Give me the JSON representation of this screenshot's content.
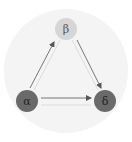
{
  "diagram": {
    "background": {
      "cx": 66,
      "cy": 71,
      "r": 62,
      "fill": "#f4f4f4"
    },
    "nodes": [
      {
        "id": "beta",
        "label": "β",
        "cx": 66,
        "cy": 29,
        "r": 11,
        "fill": "#d6d6d6",
        "text_color": "#555555"
      },
      {
        "id": "alpha",
        "label": "α",
        "cx": 27,
        "cy": 101,
        "r": 11,
        "fill": "#6a6a6a",
        "text_color": "#222222"
      },
      {
        "id": "delta",
        "label": "δ",
        "cx": 105,
        "cy": 101,
        "r": 11,
        "fill": "#6a6a6a",
        "text_color": "#222222"
      }
    ],
    "edges": [
      {
        "from": "alpha",
        "to": "beta",
        "style": "solid"
      },
      {
        "from": "beta",
        "to": "delta",
        "style": "solid"
      },
      {
        "from": "alpha",
        "to": "delta",
        "style": "solid"
      },
      {
        "from": "beta",
        "to": "alpha",
        "style": "faint"
      },
      {
        "from": "delta",
        "to": "beta",
        "style": "faint"
      },
      {
        "from": "delta",
        "to": "alpha",
        "style": "faint"
      }
    ],
    "colors": {
      "edge": "#555555",
      "edge_faint": "#dcdcdc"
    }
  }
}
